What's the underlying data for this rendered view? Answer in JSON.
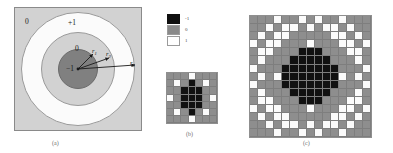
{
  "figure": {
    "panels": [
      {
        "id": "a",
        "caption": "(a)"
      },
      {
        "id": "b",
        "caption": "(b)"
      },
      {
        "id": "c",
        "caption": "(c)"
      }
    ]
  },
  "panel_a": {
    "region_labels": {
      "corner": "0",
      "outer_annulus": "+1",
      "mid_annulus": "0",
      "core_disc": "−1"
    },
    "radius_labels": [
      {
        "name": "r1",
        "base": "r",
        "sub": "1"
      },
      {
        "name": "r2",
        "base": "r",
        "sub": "2"
      },
      {
        "name": "r3",
        "base": "r",
        "sub": "3"
      }
    ],
    "colors": {
      "background": "#d2d2d2",
      "outer_ring": "#fbfbfb",
      "mid_ring": "#d2d2d2",
      "core": "#808080",
      "outline": "#8a8a8a"
    }
  },
  "legend": {
    "entries": [
      {
        "swatch": "black",
        "color": "#101010",
        "label": "-1"
      },
      {
        "swatch": "gray",
        "color": "#8a8a8a",
        "label": "0"
      },
      {
        "swatch": "white",
        "color": "#ffffff",
        "label": "1"
      }
    ]
  },
  "chart_data": {
    "type": "heatmap",
    "title": "",
    "xlabel": "",
    "ylabel": "",
    "legend_position": "top-center",
    "value_colors": {
      "-1": "#111111",
      "0": "#8e8e8e",
      "1": "#fbfbfb"
    },
    "panels": [
      {
        "id": "b",
        "caption": "(b)",
        "rows": 7,
        "cols": 7,
        "values": [
          [
            0,
            0,
            0,
            1,
            0,
            0,
            0
          ],
          [
            0,
            1,
            0,
            -1,
            0,
            1,
            0
          ],
          [
            0,
            0,
            -1,
            -1,
            -1,
            0,
            0
          ],
          [
            1,
            0,
            -1,
            -1,
            -1,
            0,
            1
          ],
          [
            0,
            0,
            -1,
            -1,
            -1,
            0,
            0
          ],
          [
            0,
            1,
            0,
            -1,
            0,
            1,
            0
          ],
          [
            0,
            0,
            0,
            1,
            0,
            0,
            0
          ]
        ]
      },
      {
        "id": "c",
        "caption": "(c)",
        "rows": 15,
        "cols": 15,
        "values": [
          [
            0,
            0,
            0,
            1,
            0,
            0,
            1,
            0,
            1,
            0,
            0,
            1,
            0,
            0,
            0
          ],
          [
            0,
            0,
            1,
            0,
            1,
            1,
            0,
            1,
            0,
            1,
            1,
            0,
            1,
            0,
            0
          ],
          [
            0,
            1,
            0,
            1,
            1,
            0,
            0,
            0,
            0,
            0,
            1,
            1,
            0,
            1,
            0
          ],
          [
            1,
            0,
            1,
            1,
            0,
            0,
            0,
            1,
            0,
            0,
            0,
            1,
            1,
            0,
            1
          ],
          [
            0,
            1,
            1,
            0,
            0,
            0,
            -1,
            -1,
            -1,
            0,
            0,
            0,
            1,
            1,
            0
          ],
          [
            0,
            1,
            0,
            0,
            0,
            -1,
            -1,
            -1,
            -1,
            -1,
            0,
            0,
            0,
            1,
            0
          ],
          [
            1,
            0,
            0,
            0,
            -1,
            -1,
            -1,
            -1,
            -1,
            -1,
            -1,
            0,
            0,
            0,
            1
          ],
          [
            0,
            1,
            0,
            1,
            -1,
            -1,
            -1,
            -1,
            -1,
            -1,
            -1,
            1,
            0,
            1,
            0
          ],
          [
            1,
            0,
            0,
            0,
            -1,
            -1,
            -1,
            -1,
            -1,
            -1,
            -1,
            0,
            0,
            0,
            1
          ],
          [
            0,
            1,
            0,
            0,
            0,
            -1,
            -1,
            -1,
            -1,
            -1,
            0,
            0,
            0,
            1,
            0
          ],
          [
            0,
            1,
            1,
            0,
            0,
            0,
            -1,
            -1,
            -1,
            0,
            0,
            0,
            1,
            1,
            0
          ],
          [
            1,
            0,
            1,
            1,
            0,
            0,
            0,
            1,
            0,
            0,
            0,
            1,
            1,
            0,
            1
          ],
          [
            0,
            1,
            0,
            1,
            1,
            0,
            0,
            0,
            0,
            0,
            1,
            1,
            0,
            1,
            0
          ],
          [
            0,
            0,
            1,
            0,
            1,
            1,
            0,
            1,
            0,
            1,
            1,
            0,
            1,
            0,
            0
          ],
          [
            0,
            0,
            0,
            1,
            0,
            0,
            1,
            0,
            1,
            0,
            0,
            1,
            0,
            0,
            0
          ]
        ]
      }
    ]
  }
}
